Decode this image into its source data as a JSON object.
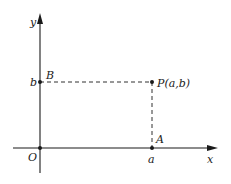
{
  "diagram": {
    "axes": {
      "x_label": "x",
      "y_label": "y",
      "origin_label": "O"
    },
    "points": {
      "P": {
        "label": "P(a,b)"
      },
      "A": {
        "label": "A",
        "coord_label": "a"
      },
      "B": {
        "label": "B",
        "coord_label": "b"
      }
    },
    "colors": {
      "ink": "#1a1a1a",
      "background": "#ffffff"
    }
  }
}
